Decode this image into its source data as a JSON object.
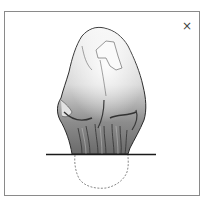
{
  "panel": {
    "close_label": "×"
  },
  "illustration": {
    "subject": "rock-stone-drawing",
    "ground_line_color": "#1a1a1a",
    "outline_color": "#2a2a2a",
    "buried_outline_style": "dashed",
    "buried_outline_color": "#6a6a6a"
  }
}
